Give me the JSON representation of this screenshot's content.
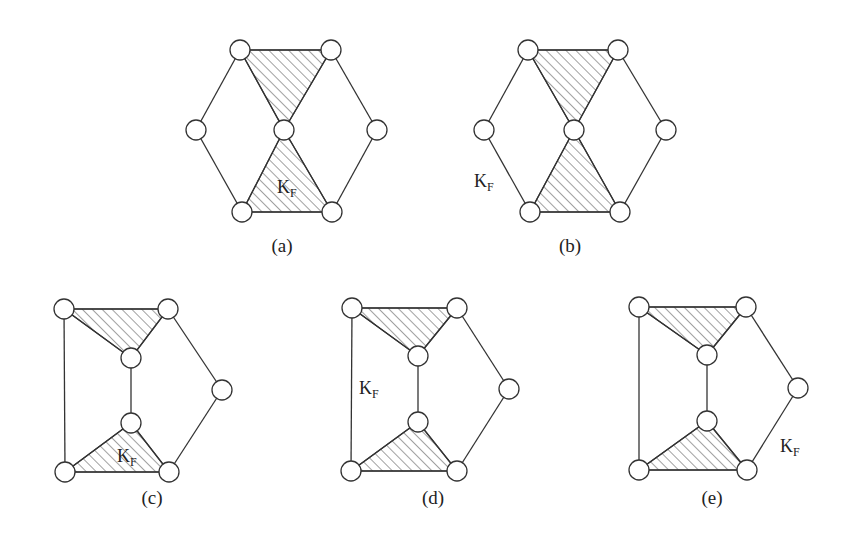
{
  "figure": {
    "node_radius": 10,
    "stroke_color": "#333333",
    "panels": [
      {
        "id": "a",
        "caption": "(a)",
        "caption_pos": [
          282,
          252
        ],
        "kf_label": {
          "main": "K",
          "sub": "F",
          "pos": [
            277,
            193
          ]
        },
        "nodes": [
          [
            240,
            50
          ],
          [
            331,
            50
          ],
          [
            196,
            130
          ],
          [
            284,
            130
          ],
          [
            377,
            130
          ],
          [
            242,
            212
          ],
          [
            332,
            212
          ]
        ],
        "edges": [
          [
            0,
            1
          ],
          [
            0,
            2
          ],
          [
            2,
            5
          ],
          [
            5,
            6
          ],
          [
            1,
            4
          ],
          [
            4,
            6
          ],
          [
            0,
            3
          ],
          [
            1,
            3
          ],
          [
            3,
            5
          ],
          [
            3,
            6
          ]
        ],
        "shaded_triangles": [
          [
            0,
            1,
            3
          ],
          [
            3,
            5,
            6
          ]
        ]
      },
      {
        "id": "b",
        "caption": "(b)",
        "caption_pos": [
          570,
          252
        ],
        "kf_label": {
          "main": "K",
          "sub": "F",
          "pos": [
            474,
            187
          ]
        },
        "nodes": [
          [
            528,
            50
          ],
          [
            618,
            50
          ],
          [
            484,
            130
          ],
          [
            574,
            130
          ],
          [
            666,
            130
          ],
          [
            530,
            212
          ],
          [
            620,
            212
          ]
        ],
        "edges": [
          [
            0,
            1
          ],
          [
            0,
            2
          ],
          [
            2,
            5
          ],
          [
            5,
            6
          ],
          [
            1,
            4
          ],
          [
            4,
            6
          ],
          [
            0,
            3
          ],
          [
            1,
            3
          ],
          [
            3,
            5
          ],
          [
            3,
            6
          ]
        ],
        "shaded_triangles": [
          [
            0,
            1,
            3
          ],
          [
            3,
            5,
            6
          ]
        ]
      },
      {
        "id": "c",
        "caption": "(c)",
        "caption_pos": [
          152,
          504
        ],
        "kf_label": {
          "main": "K",
          "sub": "F",
          "pos": [
            117,
            462
          ]
        },
        "nodes": [
          [
            64,
            309
          ],
          [
            168,
            309
          ],
          [
            131,
            358
          ],
          [
            222,
            390
          ],
          [
            131,
            423
          ],
          [
            65,
            472
          ],
          [
            169,
            472
          ]
        ],
        "edges": [
          [
            0,
            1
          ],
          [
            0,
            5
          ],
          [
            5,
            6
          ],
          [
            1,
            3
          ],
          [
            3,
            6
          ],
          [
            0,
            2
          ],
          [
            1,
            2
          ],
          [
            2,
            4
          ],
          [
            4,
            5
          ],
          [
            4,
            6
          ]
        ],
        "shaded_triangles": [
          [
            0,
            1,
            2
          ],
          [
            4,
            5,
            6
          ]
        ]
      },
      {
        "id": "d",
        "caption": "(d)",
        "caption_pos": [
          433,
          504
        ],
        "kf_label": {
          "main": "K",
          "sub": "F",
          "pos": [
            359,
            394
          ]
        },
        "nodes": [
          [
            352,
            308
          ],
          [
            457,
            308
          ],
          [
            418,
            356
          ],
          [
            509,
            389
          ],
          [
            418,
            422
          ],
          [
            351,
            471
          ],
          [
            457,
            471
          ]
        ],
        "edges": [
          [
            0,
            1
          ],
          [
            0,
            5
          ],
          [
            5,
            6
          ],
          [
            1,
            3
          ],
          [
            3,
            6
          ],
          [
            0,
            2
          ],
          [
            1,
            2
          ],
          [
            2,
            4
          ],
          [
            4,
            5
          ],
          [
            4,
            6
          ]
        ],
        "shaded_triangles": [
          [
            0,
            1,
            2
          ],
          [
            4,
            5,
            6
          ]
        ]
      },
      {
        "id": "e",
        "caption": "(e)",
        "caption_pos": [
          712,
          504
        ],
        "kf_label": {
          "main": "K",
          "sub": "F",
          "pos": [
            780,
            452
          ]
        },
        "nodes": [
          [
            639,
            307
          ],
          [
            746,
            307
          ],
          [
            707,
            355
          ],
          [
            798,
            388
          ],
          [
            707,
            421
          ],
          [
            639,
            470
          ],
          [
            747,
            470
          ]
        ],
        "edges": [
          [
            0,
            1
          ],
          [
            0,
            5
          ],
          [
            5,
            6
          ],
          [
            1,
            3
          ],
          [
            3,
            6
          ],
          [
            0,
            2
          ],
          [
            1,
            2
          ],
          [
            2,
            4
          ],
          [
            4,
            5
          ],
          [
            4,
            6
          ]
        ],
        "shaded_triangles": [
          [
            0,
            1,
            2
          ],
          [
            4,
            5,
            6
          ]
        ]
      }
    ]
  }
}
